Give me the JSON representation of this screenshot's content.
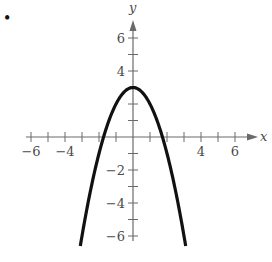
{
  "chart_data": {
    "type": "line",
    "title": "",
    "xlabel": "x",
    "ylabel": "y",
    "xlim": [
      -6.5,
      7
    ],
    "ylim": [
      -6.6,
      7
    ],
    "grid": false,
    "legend": null,
    "x_ticks": [
      -6,
      -5,
      -4,
      -3,
      -2,
      -1,
      1,
      2,
      3,
      4,
      5,
      6
    ],
    "x_tick_labels": [
      {
        "value": -6,
        "label": "−6"
      },
      {
        "value": -4,
        "label": "−4"
      },
      {
        "value": 4,
        "label": "4"
      },
      {
        "value": 6,
        "label": "6"
      }
    ],
    "y_ticks": [
      -6,
      -5,
      -4,
      -3,
      -2,
      -1,
      1,
      2,
      3,
      4,
      5,
      6
    ],
    "y_tick_labels": [
      {
        "value": 6,
        "label": "6"
      },
      {
        "value": 4,
        "label": "4"
      },
      {
        "value": -2,
        "label": "−2"
      },
      {
        "value": -4,
        "label": "−4"
      },
      {
        "value": -6,
        "label": "−6"
      }
    ],
    "series": [
      {
        "name": "parabola",
        "equation": "y = -x^2 + 3",
        "vertex": [
          0,
          3
        ],
        "x": [
          -3.1,
          -3,
          -2.5,
          -2,
          -1.5,
          -1,
          -0.5,
          0,
          0.5,
          1,
          1.5,
          2,
          2.5,
          3,
          3.1
        ],
        "values": [
          -6.61,
          -6,
          -3.25,
          -1,
          0.75,
          2,
          2.75,
          3,
          2.75,
          2,
          0.75,
          -1,
          -3.25,
          -6,
          -6.61
        ]
      }
    ],
    "marker": "•"
  }
}
